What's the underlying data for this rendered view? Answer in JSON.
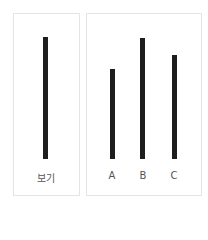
{
  "reference": {
    "label": "보기",
    "bar_top": 37,
    "bar_bottom": 159
  },
  "options": [
    {
      "label": "A",
      "bar_top": 69,
      "bar_bottom": 159
    },
    {
      "label": "B",
      "bar_top": 38,
      "bar_bottom": 159
    },
    {
      "label": "C",
      "bar_top": 55,
      "bar_bottom": 159
    }
  ],
  "colors": {
    "bar": "#1e1e1e",
    "border": "#e4e4e4",
    "label": "#555555"
  }
}
